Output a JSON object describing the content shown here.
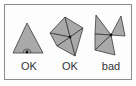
{
  "diagram": {
    "colors": {
      "fill": "#a9a9a9",
      "stroke": "#3a3a3a",
      "frame": "#8a8a8a",
      "text": "#333333"
    },
    "figures": [
      {
        "id": "figure-1",
        "label": "OK",
        "description": "single triangle with vertex on base edge",
        "triangles": [
          [
            [
              27,
              23
            ],
            [
              13,
              53
            ],
            [
              43,
              53
            ]
          ]
        ],
        "vertex": [
          27,
          52
        ]
      },
      {
        "id": "figure-2",
        "label": "OK",
        "description": "fan of triangles around a shared interior vertex",
        "triangles": [
          [
            [
              50,
              33
            ],
            [
              65,
              17
            ],
            [
              70,
              37
            ]
          ],
          [
            [
              65,
              17
            ],
            [
              83,
              28
            ],
            [
              70,
              37
            ]
          ],
          [
            [
              83,
              28
            ],
            [
              75,
              56
            ],
            [
              70,
              37
            ]
          ],
          [
            [
              75,
              56
            ],
            [
              57,
              46
            ],
            [
              70,
              37
            ]
          ],
          [
            [
              57,
              46
            ],
            [
              50,
              33
            ],
            [
              70,
              37
            ]
          ]
        ],
        "vertex": [
          70,
          37
        ]
      },
      {
        "id": "figure-3",
        "label": "bad",
        "description": "triangles meeting at a vertex without forming a closed fan",
        "triangles": [
          [
            [
              96,
              15
            ],
            [
              95,
              34
            ],
            [
              111,
              35
            ]
          ],
          [
            [
              111,
              35
            ],
            [
              121,
              16
            ],
            [
              125,
              36
            ]
          ],
          [
            [
              95,
              34
            ],
            [
              111,
              35
            ],
            [
              95,
              50
            ]
          ],
          [
            [
              95,
              50
            ],
            [
              111,
              35
            ],
            [
              115,
              55
            ]
          ]
        ],
        "vertex": [
          111,
          35
        ]
      }
    ]
  }
}
